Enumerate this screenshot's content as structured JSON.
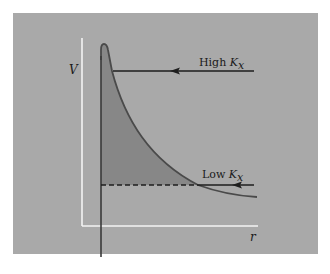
{
  "diagram": {
    "y_axis_label": "V",
    "x_axis_label": "r",
    "annotations": [
      {
        "id": "high",
        "text": "High ",
        "var": "K",
        "sub": "x"
      },
      {
        "id": "low",
        "text": "Low ",
        "var": "K",
        "sub": "x"
      }
    ]
  },
  "colors": {
    "page_background": "#ffffff",
    "panel_background": "#a9a9a9",
    "axes": "#f4f4f4",
    "shaded_area": "#878787",
    "curve": "#4a4a4a",
    "lines": "#1e1e1e"
  }
}
